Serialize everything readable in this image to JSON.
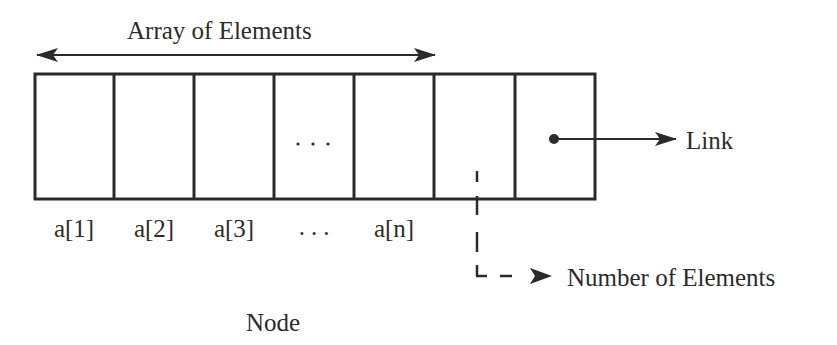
{
  "diagram": {
    "type": "data-structure",
    "title": "Node",
    "array_label": "Array of Elements",
    "cells": [
      {
        "label": "a[1]",
        "content": ""
      },
      {
        "label": "a[2]",
        "content": ""
      },
      {
        "label": "a[3]",
        "content": ""
      },
      {
        "label": "...",
        "content": "..."
      },
      {
        "label": "a[n]",
        "content": ""
      },
      {
        "label": "",
        "content": "",
        "role": "count-field"
      },
      {
        "label": "",
        "content": "•",
        "role": "link-field"
      }
    ],
    "annotations": {
      "link": "Link",
      "count": "Number of Elements",
      "node": "Node"
    },
    "colors": {
      "stroke": "#2a2a2a",
      "text": "#2b2b2b",
      "background": "#ffffff"
    }
  }
}
